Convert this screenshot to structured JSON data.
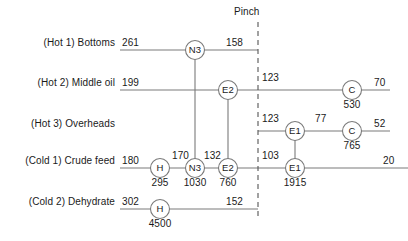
{
  "diagram": {
    "pinch_label": "Pinch",
    "pinch_x": 258,
    "line_color": "#7a7a7a",
    "text_color": "#1a1a1a",
    "streams": [
      {
        "id": "hot1",
        "label": "(Hot 1) Bottoms",
        "label_x": 115,
        "y": 50,
        "line_start": 120,
        "line_end": 258,
        "inlet_temp": "261",
        "inlet_temp_x": 122,
        "outlet_temp": "158",
        "outlet_temp_x": 226
      },
      {
        "id": "hot2",
        "label": "(Hot 2) Middle oil",
        "label_x": 115,
        "y": 90,
        "line_start": 120,
        "line_end": 390,
        "inlet_temp": "199",
        "inlet_temp_x": 122,
        "outlet_temp": "70",
        "outlet_temp_x": 374
      },
      {
        "id": "hot3",
        "label": "(Hot 3) Overheads",
        "label_x": 115,
        "y": 131,
        "line_start": 258,
        "line_end": 390,
        "inlet_temp": "",
        "inlet_temp_x": 0,
        "outlet_temp": "52",
        "outlet_temp_x": 374
      },
      {
        "id": "cold1",
        "label": "(Cold 1) Crude feed",
        "label_x": 115,
        "y": 168,
        "line_start": 120,
        "line_end": 408,
        "inlet_temp": "180",
        "inlet_temp_x": 122,
        "outlet_temp": "20",
        "outlet_temp_x": 383
      },
      {
        "id": "cold2",
        "label": "(Cold 2) Dehydrate",
        "label_x": 115,
        "y": 209,
        "line_start": 120,
        "line_end": 258,
        "inlet_temp": "302",
        "inlet_temp_x": 122,
        "outlet_temp": "152",
        "outlet_temp_x": 226
      }
    ],
    "mid_temps": [
      {
        "id": "hot2-pinch",
        "value": "123",
        "x": 262,
        "y": 82
      },
      {
        "id": "hot3-pinch",
        "value": "123",
        "x": 262,
        "y": 123
      },
      {
        "id": "hot3-after-e1",
        "value": "77",
        "x": 315,
        "y": 123
      },
      {
        "id": "cold1-after-h",
        "value": "170",
        "x": 172,
        "y": 160
      },
      {
        "id": "cold1-after-n3",
        "value": "132",
        "x": 204,
        "y": 160
      },
      {
        "id": "cold1-pinch",
        "value": "103",
        "x": 262,
        "y": 160
      }
    ],
    "units": [
      {
        "id": "n3-hot1",
        "type": "N3",
        "cx": 195,
        "cy": 50,
        "duty": "",
        "duty_y": 0
      },
      {
        "id": "e2-hot2",
        "type": "E2",
        "cx": 228,
        "cy": 90,
        "duty": "",
        "duty_y": 0
      },
      {
        "id": "c-hot2",
        "type": "C",
        "cx": 352,
        "cy": 90,
        "duty": "530",
        "duty_y": 103
      },
      {
        "id": "e1-hot3",
        "type": "E1",
        "cx": 295,
        "cy": 131,
        "duty": "",
        "duty_y": 0
      },
      {
        "id": "c-hot3",
        "type": "C",
        "cx": 352,
        "cy": 131,
        "duty": "765",
        "duty_y": 144
      },
      {
        "id": "h-cold1",
        "type": "H",
        "cx": 160,
        "cy": 168,
        "duty": "295",
        "duty_y": 181
      },
      {
        "id": "n3-cold1",
        "type": "N3",
        "cx": 195,
        "cy": 168,
        "duty": "1030",
        "duty_y": 181
      },
      {
        "id": "e2-cold1",
        "type": "E2",
        "cx": 228,
        "cy": 168,
        "duty": "760",
        "duty_y": 181
      },
      {
        "id": "e1-cold1",
        "type": "E1",
        "cx": 295,
        "cy": 168,
        "duty": "1915",
        "duty_y": 181
      },
      {
        "id": "h-cold2",
        "type": "H",
        "cx": 160,
        "cy": 209,
        "duty": "4500",
        "duty_y": 222
      }
    ],
    "connectors": [
      {
        "id": "n3-connector",
        "x": 195,
        "y1": 50,
        "y2": 168
      },
      {
        "id": "e2-connector",
        "x": 228,
        "y1": 90,
        "y2": 168
      },
      {
        "id": "e1-connector",
        "x": 295,
        "y1": 131,
        "y2": 168
      }
    ]
  }
}
